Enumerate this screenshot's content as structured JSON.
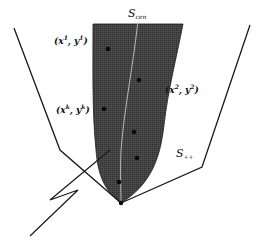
{
  "diagram": {
    "type": "set-geometry",
    "colors": {
      "background": "#ffffff",
      "stroke": "#1a1a1a",
      "shaded_region": "#3c3c3c",
      "dot": "#0a0a0a"
    },
    "labels": {
      "central_path": {
        "base": "S",
        "subscript": "cen"
      },
      "feasible_set": {
        "base": "S",
        "subscript": "++"
      },
      "point_1": {
        "text": "(x",
        "sup": "1",
        "mid": ", y",
        "sup2": "1",
        "end": ")"
      },
      "point_2": {
        "text": "(x",
        "sup": "2",
        "mid": ", y",
        "sup2": "2",
        "end": ")"
      },
      "point_k": {
        "text": "(x",
        "sup": "k",
        "mid": ", y",
        "sup2": "k",
        "end": ")"
      }
    },
    "shapes": {
      "shaded_neighborhood": "M93,24 L183,24 C176,60 168,90 164,125 C160,160 150,185 121,203 C104,190 98,175 96,150 C92,110 93,70 93,24 Z",
      "central_path_curve": "M138,20 C134,60 124,110 121,150 C120,175 121,190 121,203",
      "left_boundary": [
        [
          14,
          28
        ],
        [
          60,
          150
        ],
        [
          121,
          203
        ]
      ],
      "right_boundary": [
        [
          250,
          25
        ],
        [
          202,
          167
        ],
        [
          121,
          203
        ]
      ],
      "jagged_arrow": [
        [
          30,
          236
        ],
        [
          78,
          190
        ],
        [
          50,
          200
        ],
        [
          110,
          150
        ]
      ]
    },
    "points": [
      {
        "id": "x1y1",
        "cx": 108,
        "cy": 49
      },
      {
        "id": "x2y2",
        "cx": 139,
        "cy": 80
      },
      {
        "id": "xkyk",
        "cx": 104,
        "cy": 109
      },
      {
        "id": "p4",
        "cx": 134,
        "cy": 132
      },
      {
        "id": "p5",
        "cx": 137,
        "cy": 158
      },
      {
        "id": "p6",
        "cx": 119,
        "cy": 182
      },
      {
        "id": "apex",
        "cx": 121,
        "cy": 203
      }
    ]
  }
}
